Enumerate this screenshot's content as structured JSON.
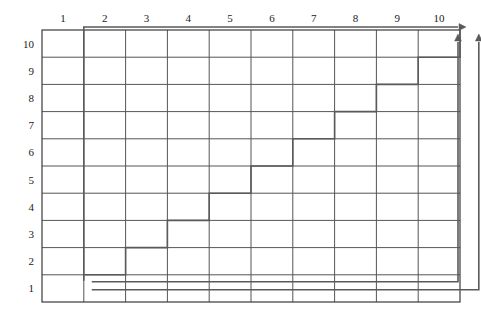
{
  "figure": {
    "name": "lattice-staircase-path-diagram",
    "type": "grid-diagram",
    "background_color": "#ffffff",
    "grid": {
      "columns": 10,
      "rows": 10,
      "x_origin": 42,
      "y_origin": 30,
      "cell_width": 41.8,
      "cell_height": 27.2,
      "line_color": "#555555",
      "border_color": "#3a3a3a",
      "line_width": 1,
      "border_width": 1.2
    },
    "x_axis": {
      "position": "top",
      "labels": [
        "1",
        "2",
        "3",
        "4",
        "5",
        "6",
        "7",
        "8",
        "9",
        "10"
      ],
      "label_color": "#1b1b1b",
      "label_font_size": 11
    },
    "y_axis": {
      "position": "left",
      "labels": [
        "10",
        "9",
        "8",
        "7",
        "6",
        "5",
        "4",
        "3",
        "2",
        "1"
      ],
      "label_color": "#1b1b1b",
      "label_font_size": 11
    },
    "paths": {
      "stroke_color": "#5a5a5a",
      "stroke_width": 1.6,
      "staircase": {
        "name": "monotone-staircase-path",
        "description": "Rising step path from lower-left to upper-right through the lattice",
        "points": [
          [
            1,
            1
          ],
          [
            2,
            1
          ],
          [
            2,
            2
          ],
          [
            3,
            2
          ],
          [
            3,
            3
          ],
          [
            4,
            3
          ],
          [
            4,
            4
          ],
          [
            5,
            4
          ],
          [
            5,
            5
          ],
          [
            6,
            5
          ],
          [
            6,
            6
          ],
          [
            7,
            6
          ],
          [
            7,
            7
          ],
          [
            8,
            7
          ],
          [
            8,
            8
          ],
          [
            9,
            8
          ],
          [
            9,
            9
          ],
          [
            10,
            9
          ],
          [
            10,
            10
          ]
        ]
      },
      "boundary_upper": {
        "name": "upper-boundary-path",
        "description": "Vertical line at column 1 rising to row 10, then horizontal right with arrowhead",
        "points": [
          [
            1,
            1
          ],
          [
            1,
            10
          ],
          [
            10,
            10
          ]
        ],
        "arrow_at_end": true,
        "arrow_direction": "right"
      },
      "boundary_lower_a": {
        "name": "lower-boundary-path-a",
        "description": "Horizontal line at row 1.5 going right then turning up with arrowhead",
        "points": [
          [
            1,
            1
          ],
          [
            10,
            1
          ],
          [
            10,
            10
          ]
        ],
        "arrow_at_end": true,
        "arrow_direction": "up"
      },
      "boundary_lower_b": {
        "name": "lower-boundary-path-b",
        "description": "Lower horizontal line at row 1 going right then turning up with arrowhead",
        "points": [
          [
            1,
            1
          ],
          [
            10,
            1
          ],
          [
            10,
            10
          ]
        ],
        "arrow_at_end": true,
        "arrow_direction": "up"
      }
    }
  },
  "chart_data": {
    "type": "line",
    "title": "",
    "xlabel": "",
    "ylabel": "",
    "xlim": [
      1,
      10
    ],
    "ylim": [
      1,
      10
    ],
    "grid": true,
    "legend": "none",
    "categories": [
      "1",
      "2",
      "3",
      "4",
      "5",
      "6",
      "7",
      "8",
      "9",
      "10"
    ],
    "series": [
      {
        "name": "staircase",
        "x": [
          1,
          2,
          2,
          3,
          3,
          4,
          4,
          5,
          5,
          6,
          6,
          7,
          7,
          8,
          8,
          9,
          9,
          10,
          10
        ],
        "values": [
          1,
          1,
          2,
          2,
          3,
          3,
          4,
          4,
          5,
          5,
          6,
          6,
          7,
          7,
          8,
          8,
          9,
          9,
          10
        ]
      },
      {
        "name": "upper-boundary",
        "x": [
          1,
          1,
          10
        ],
        "values": [
          1,
          10,
          10
        ]
      },
      {
        "name": "lower-boundary-a",
        "x": [
          1,
          10,
          10
        ],
        "values": [
          1.5,
          1.5,
          10
        ]
      },
      {
        "name": "lower-boundary-b",
        "x": [
          1,
          10,
          10
        ],
        "values": [
          1,
          1,
          10
        ]
      }
    ]
  }
}
